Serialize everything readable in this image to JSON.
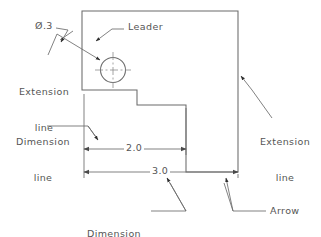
{
  "drawing": {
    "title": "Dimensioning terminology illustration",
    "background_color": "#ffffff",
    "line_color": "#6b6b6b",
    "text_color": "#555555",
    "annotations": {
      "hole_diameter": "Ø.3",
      "leader": "Leader",
      "extension_line_left": "Extension\nline",
      "extension_line_left_l1": "Extension",
      "extension_line_left_l2": "line",
      "dimension_line": "Dimension\nline",
      "dimension_line_l1": "Dimension",
      "dimension_line_l2": "line",
      "extension_line_right": "Extension\nline",
      "extension_line_right_l1": "Extension",
      "extension_line_right_l2": "line",
      "dimension_text": "Dimension\ntext",
      "dimension_text_l1": "Dimension",
      "dimension_text_l2": "text",
      "arrow": "Arrow"
    },
    "dimensions": [
      {
        "name": "inner-width",
        "value": "2.0"
      },
      {
        "name": "overall-width",
        "value": "3.0"
      }
    ],
    "part_outline": {
      "shape": "stepped-block",
      "vertices": "(82,11) (238,11) (238,172) (186,172) (186,105) (137,105) (137,90) (82,90)"
    },
    "hole": {
      "label": "Ø.3",
      "center": "(113,70)",
      "diameter": "0.3"
    }
  }
}
